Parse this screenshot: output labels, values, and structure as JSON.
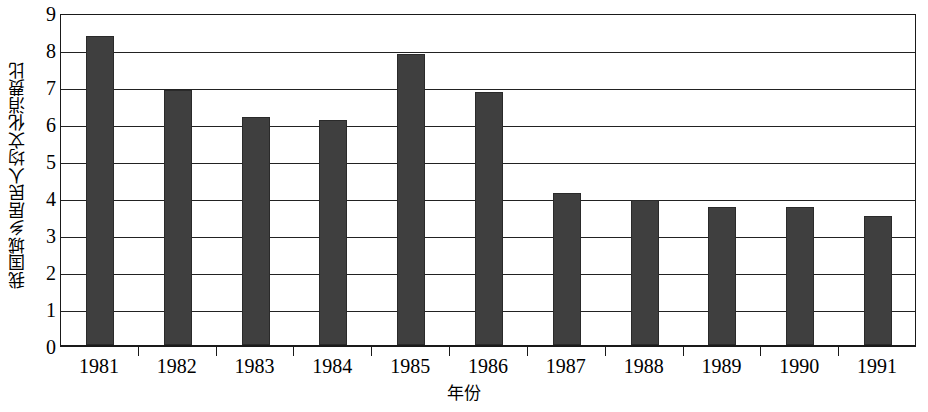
{
  "chart_data": {
    "type": "bar",
    "title": "",
    "xlabel": "年份",
    "ylabel": "我国城乡居民人均文化消费比",
    "categories": [
      "1981",
      "1982",
      "1983",
      "1984",
      "1985",
      "1986",
      "1987",
      "1988",
      "1989",
      "1990",
      "1991"
    ],
    "values": [
      8.35,
      6.9,
      6.15,
      6.08,
      7.87,
      6.83,
      4.1,
      3.93,
      3.72,
      3.72,
      3.5
    ],
    "series": [
      {
        "name": "我国城乡居民人均文化消费比",
        "values": [
          8.35,
          6.9,
          6.15,
          6.08,
          7.87,
          6.83,
          4.1,
          3.93,
          3.72,
          3.72,
          3.5
        ]
      }
    ],
    "ylim": [
      0,
      9
    ],
    "y_ticks": [
      0,
      1,
      2,
      3,
      4,
      5,
      6,
      7,
      8,
      9
    ],
    "y_tick_labels": [
      "0",
      "1",
      "2",
      "3",
      "4",
      "5",
      "6",
      "7",
      "8",
      "9"
    ],
    "grid": "horizontal",
    "legend": "none",
    "bar_color": "#3f3f3f",
    "axis_color": "#1a1a1a",
    "background": "#ffffff"
  }
}
